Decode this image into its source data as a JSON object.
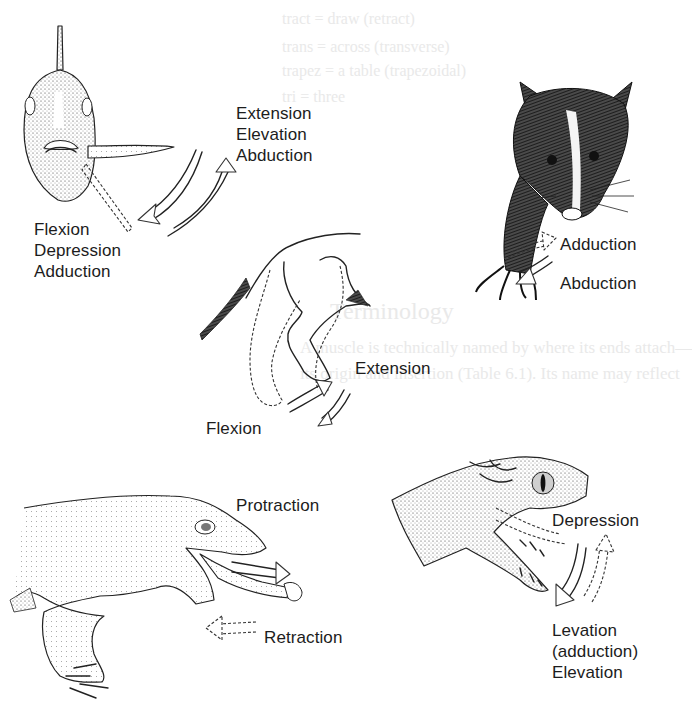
{
  "figure": {
    "panels": {
      "fish": {
        "subject": "fish-pectoral-fin",
        "labels_right": [
          "Extension",
          "Elevation",
          "Abduction"
        ],
        "labels_left": [
          "Flexion",
          "Depression",
          "Adduction"
        ]
      },
      "shrew": {
        "subject": "mammal-forelimb",
        "labels": [
          "Adduction",
          "Abduction"
        ]
      },
      "dog_leg": {
        "subject": "mammal-hindlimb",
        "labels": {
          "extension": "Extension",
          "flexion": "Flexion"
        }
      },
      "lizard": {
        "subject": "lizard-tongue",
        "labels": {
          "protraction": "Protraction",
          "retraction": "Retraction"
        }
      },
      "snake": {
        "subject": "snake-jaw",
        "labels_top": [
          "Depression"
        ],
        "labels_bottom": [
          "Levation",
          "(adduction)",
          "Elevation"
        ]
      }
    },
    "background_bleedthrough": [
      "tract = draw (retract)",
      "trans = across (transverse)",
      "trapez = a table (trapezoidal)",
      "tri = three",
      "Terminology",
      "A muscle is technically named by where its ends attach—",
      "its origin and insertion (Table 6.1). Its name may reflect"
    ]
  }
}
